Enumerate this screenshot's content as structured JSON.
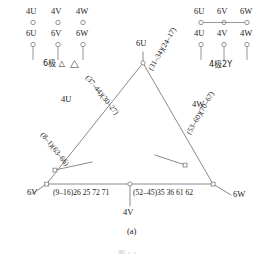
{
  "figure": {
    "caption": "(a)",
    "cropped_bottom_caption": "图 1-2",
    "type": "motor-winding-connection-diagram"
  },
  "terminal_block_left": {
    "group_label": "6极 △",
    "top_row": [
      "4U",
      "4V",
      "4W"
    ],
    "bottom_row": [
      "6U",
      "6V",
      "6W"
    ]
  },
  "terminal_block_right": {
    "group_label": "4极2Y",
    "top_row": [
      "6U",
      "6V",
      "6W"
    ],
    "bottom_row": [
      "4U",
      "4V",
      "4W"
    ]
  },
  "triangle": {
    "apex_label": "6U",
    "left_lead_label": "4U",
    "right_lead_label": "4W",
    "bottom_left_label": "6V",
    "bottom_right_label": "6W",
    "bottom_center_label": "4V",
    "left_upper_coil": "(37–44)(30–27)",
    "right_upper_coil": "(31–34)(24–17)",
    "left_lower_coil": "(8–1)(63–66)",
    "right_lower_coil": "(53–60)(70–67)",
    "bottom_left_coil": "(9–16)26 25 72 71",
    "bottom_right_coil": "(52–45)35 36 61 62"
  },
  "colors": {
    "line": "#8a8a8a",
    "text": "#1a1a1a",
    "background": "#ffffff"
  }
}
